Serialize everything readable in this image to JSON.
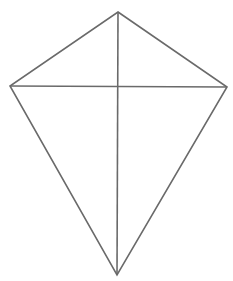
{
  "diagram": {
    "shape": "kite",
    "stroke_color": "#6a6a6a",
    "background": "#ffffff",
    "vertices": {
      "top": [
        118,
        12
      ],
      "left": [
        10,
        86
      ],
      "right": [
        227,
        87
      ],
      "bottom": [
        117,
        275
      ]
    },
    "diagonals": [
      {
        "from": "top",
        "to": "bottom"
      },
      {
        "from": "left",
        "to": "right"
      }
    ]
  }
}
